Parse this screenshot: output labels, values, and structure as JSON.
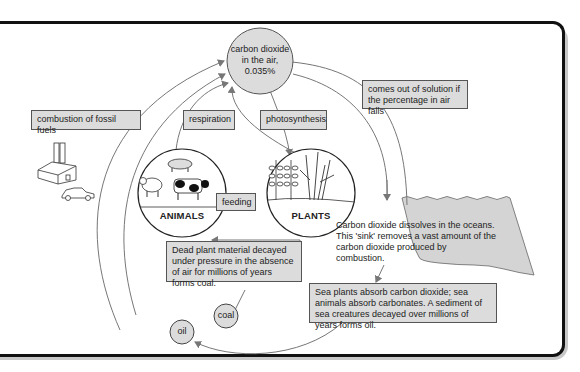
{
  "colors": {
    "box_fill": "#dcdcdc",
    "node_fill": "#dcdcdc",
    "ocean_fill": "#d4d4d4",
    "line": "#777777",
    "frame": "#111111",
    "shadow": "#c8c8c8"
  },
  "nodes": {
    "co2": {
      "line1": "carbon dioxide",
      "line2": "in the air,",
      "line3": "0.035%"
    },
    "animals": {
      "label": "ANIMALS",
      "icons": [
        "pig-icon",
        "sheep-icon",
        "cow-icon"
      ]
    },
    "plants": {
      "label": "PLANTS",
      "icons": [
        "wheat-icon",
        "reed-icon"
      ]
    },
    "coal": {
      "label": "coal"
    },
    "oil": {
      "label": "oil"
    }
  },
  "labels": {
    "combustion": "combustion of fossil fuels",
    "respiration": "respiration",
    "photosynthesis": "photosynthesis",
    "comes_out": "comes out of solution if the percentage in air falls",
    "feeding": "feeding",
    "dead_plant": "Dead plant material decayed under pressure in the absence of air for millions of years forms coal.",
    "ocean": "Carbon dioxide dissolves in the oceans. This 'sink' removes a vast amount of the carbon dioxide produced by combustion.",
    "sea_plants": "Sea plants absorb carbon dioxide; sea animals absorb carbonates. A sediment of sea creatures decayed over millions of years forms oil."
  },
  "illustrations": [
    "factory-icon",
    "car-icon"
  ]
}
